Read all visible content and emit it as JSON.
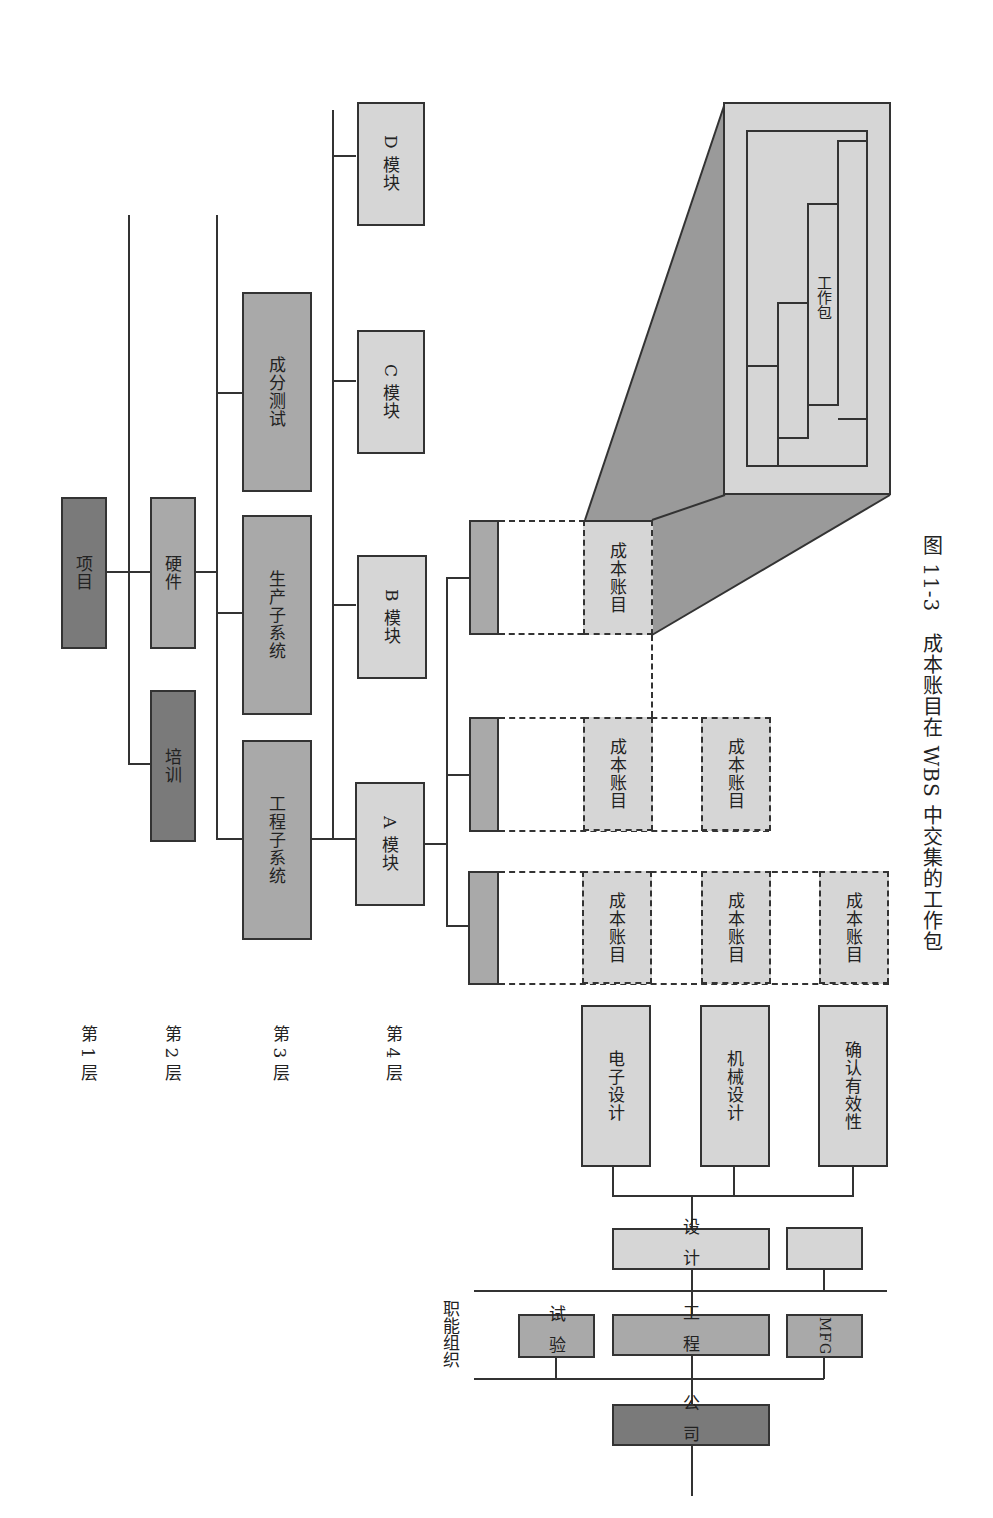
{
  "levels": {
    "l1": "第 1 层",
    "l2": "第 2 层",
    "l3": "第 3 层",
    "l4": "第 4 层"
  },
  "wbs": {
    "project": "项目",
    "level2": [
      "硬件",
      "培训"
    ],
    "level3": [
      "工程子系统",
      "生产子系统",
      "成分测试"
    ],
    "level4": [
      "A 模块",
      "B 模块",
      "C 模块",
      "D 模块"
    ]
  },
  "cost_account": "成本账目",
  "work_package": "工作包",
  "functional_org": {
    "label": "职能组织",
    "company": "公司",
    "departments": [
      "试验",
      "工程",
      "MFG"
    ],
    "sub": [
      "设计",
      ""
    ],
    "design_units": [
      "电子设计",
      "机械设计",
      "确认有效性"
    ]
  },
  "caption": "图 11-3　成本账目在 WBS 中交集的工作包",
  "colors": {
    "dark": "#7a7a7a",
    "mid": "#a9a9a9",
    "light": "#d6d6d6",
    "line": "#333333"
  }
}
